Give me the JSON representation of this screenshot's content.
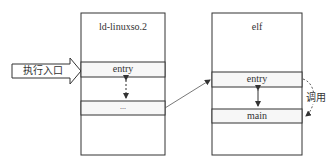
{
  "entry_arrow": {
    "label": "执行入口"
  },
  "left_box": {
    "title": "ld-linuxso.2",
    "rows": [
      {
        "label": "entry"
      },
      {
        "label": "..."
      }
    ]
  },
  "right_box": {
    "title": "elf",
    "rows": [
      {
        "label": "entry"
      },
      {
        "label": "main"
      }
    ]
  },
  "call_annotation": {
    "label": "调用"
  },
  "colors": {
    "line": "#333333",
    "row_fill": "#f7f7f7",
    "background": "#ffffff"
  }
}
